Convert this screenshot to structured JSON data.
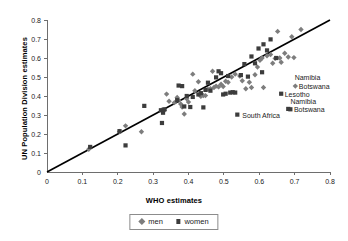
{
  "chart_data": {
    "type": "scatter",
    "title": "",
    "xlabel": "WHO estimates",
    "ylabel": "UN Population Division estimates",
    "xlim": [
      0,
      0.8
    ],
    "ylim": [
      0,
      0.8
    ],
    "xticks": [
      "0",
      "0.1",
      "0.2",
      "0.3",
      "0.4",
      "0.5",
      "0.6",
      "0.7",
      "0.8"
    ],
    "yticks": [
      "0",
      "0.1",
      "0.2",
      "0.3",
      "0.4",
      "0.5",
      "0.6",
      "0.7",
      "0.8"
    ],
    "grid": false,
    "legend_position": "bottom",
    "reference_line": {
      "type": "identity",
      "from": [
        0,
        0
      ],
      "to": [
        0.8,
        0.8
      ],
      "color": "#000000"
    },
    "series": [
      {
        "name": "men",
        "marker": "diamond",
        "color": "#7d7d7d",
        "points": [
          [
            0.118,
            0.12
          ],
          [
            0.205,
            0.213
          ],
          [
            0.222,
            0.243
          ],
          [
            0.267,
            0.212
          ],
          [
            0.325,
            0.327
          ],
          [
            0.332,
            0.325
          ],
          [
            0.338,
            0.41
          ],
          [
            0.345,
            0.372
          ],
          [
            0.36,
            0.365
          ],
          [
            0.368,
            0.392
          ],
          [
            0.372,
            0.378
          ],
          [
            0.378,
            0.358
          ],
          [
            0.382,
            0.342
          ],
          [
            0.388,
            0.305
          ],
          [
            0.395,
            0.385
          ],
          [
            0.4,
            0.368
          ],
          [
            0.412,
            0.515
          ],
          [
            0.418,
            0.428
          ],
          [
            0.428,
            0.475
          ],
          [
            0.435,
            0.398
          ],
          [
            0.442,
            0.403
          ],
          [
            0.448,
            0.402
          ],
          [
            0.455,
            0.435
          ],
          [
            0.462,
            0.438
          ],
          [
            0.468,
            0.53
          ],
          [
            0.472,
            0.445
          ],
          [
            0.478,
            0.452
          ],
          [
            0.485,
            0.448
          ],
          [
            0.492,
            0.462
          ],
          [
            0.498,
            0.45
          ],
          [
            0.505,
            0.478
          ],
          [
            0.512,
            0.472
          ],
          [
            0.522,
            0.5
          ],
          [
            0.532,
            0.515
          ],
          [
            0.545,
            0.505
          ],
          [
            0.552,
            0.48
          ],
          [
            0.562,
            0.438
          ],
          [
            0.572,
            0.472
          ],
          [
            0.578,
            0.445
          ],
          [
            0.588,
            0.512
          ],
          [
            0.595,
            0.552
          ],
          [
            0.602,
            0.588
          ],
          [
            0.608,
            0.6
          ],
          [
            0.612,
            0.445
          ],
          [
            0.622,
            0.612
          ],
          [
            0.632,
            0.618
          ],
          [
            0.638,
            0.572
          ],
          [
            0.645,
            0.598
          ],
          [
            0.652,
            0.74
          ],
          [
            0.658,
            0.6
          ],
          [
            0.662,
            0.578
          ],
          [
            0.672,
            0.625
          ],
          [
            0.682,
            0.605
          ],
          [
            0.692,
            0.712
          ],
          [
            0.698,
            0.602
          ],
          [
            0.702,
            0.452
          ],
          [
            0.718,
            0.75
          ]
        ]
      },
      {
        "name": "women",
        "marker": "square",
        "color": "#3c3c3c",
        "points": [
          [
            0.122,
            0.132
          ],
          [
            0.205,
            0.215
          ],
          [
            0.222,
            0.14
          ],
          [
            0.275,
            0.348
          ],
          [
            0.322,
            0.325
          ],
          [
            0.325,
            0.258
          ],
          [
            0.328,
            0.312
          ],
          [
            0.332,
            0.33
          ],
          [
            0.368,
            0.378
          ],
          [
            0.372,
            0.455
          ],
          [
            0.382,
            0.452
          ],
          [
            0.388,
            0.345
          ],
          [
            0.395,
            0.4
          ],
          [
            0.405,
            0.342
          ],
          [
            0.412,
            0.395
          ],
          [
            0.428,
            0.408
          ],
          [
            0.435,
            0.415
          ],
          [
            0.442,
            0.34
          ],
          [
            0.448,
            0.432
          ],
          [
            0.455,
            0.47
          ],
          [
            0.462,
            0.428
          ],
          [
            0.478,
            0.498
          ],
          [
            0.485,
            0.53
          ],
          [
            0.492,
            0.52
          ],
          [
            0.498,
            0.408
          ],
          [
            0.505,
            0.412
          ],
          [
            0.512,
            0.505
          ],
          [
            0.518,
            0.418
          ],
          [
            0.525,
            0.42
          ],
          [
            0.532,
            0.418
          ],
          [
            0.538,
            0.302
          ],
          [
            0.548,
            0.51
          ],
          [
            0.558,
            0.568
          ],
          [
            0.568,
            0.502
          ],
          [
            0.578,
            0.608
          ],
          [
            0.588,
            0.572
          ],
          [
            0.598,
            0.65
          ],
          [
            0.608,
            0.525
          ],
          [
            0.612,
            0.672
          ],
          [
            0.622,
            0.64
          ],
          [
            0.632,
            0.698
          ],
          [
            0.648,
            0.6
          ],
          [
            0.662,
            0.412
          ],
          [
            0.682,
            0.332
          ],
          [
            0.688,
            0.33
          ]
        ]
      }
    ],
    "annotations": [
      {
        "label": "Namibia",
        "x": 0.7,
        "y": 0.498,
        "align": "left"
      },
      {
        "label": "Botswana",
        "x": 0.712,
        "y": 0.452,
        "align": "left"
      },
      {
        "label": "Lesotho",
        "x": 0.672,
        "y": 0.41,
        "align": "left"
      },
      {
        "label": "Namibia",
        "x": 0.688,
        "y": 0.372,
        "align": "left"
      },
      {
        "label": "Botswana",
        "x": 0.698,
        "y": 0.33,
        "align": "left"
      },
      {
        "label": "South Africa",
        "x": 0.552,
        "y": 0.298,
        "align": "left"
      }
    ]
  },
  "legend": {
    "items": [
      {
        "label": "men",
        "marker": "diamond-icon",
        "color": "#7d7d7d"
      },
      {
        "label": "women",
        "marker": "square-icon",
        "color": "#3c3c3c"
      }
    ]
  }
}
